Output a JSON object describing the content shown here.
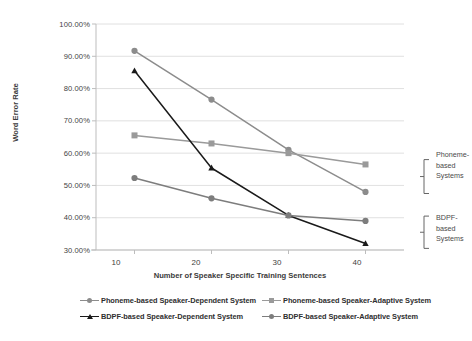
{
  "chart_data": {
    "type": "line",
    "title": "",
    "xlabel": "Number of Speaker Specific Training Sentences",
    "ylabel": "Word Error Rate",
    "x": [
      10,
      20,
      30,
      40
    ],
    "categories": [
      "10",
      "20",
      "30",
      "40"
    ],
    "xlim": [
      5,
      45
    ],
    "ylim": [
      0.3,
      1.0
    ],
    "ytick_labels": [
      "100.00%",
      "90.00%",
      "80.00%",
      "70.00%",
      "60.00%",
      "50.00%",
      "40.00%",
      "30.00%"
    ],
    "ytick_values": [
      1.0,
      0.9,
      0.8,
      0.7,
      0.6,
      0.5,
      0.4,
      0.3
    ],
    "grid": true,
    "legend_position": "bottom",
    "series": [
      {
        "name": "Phoneme-based Speaker-Dependent System",
        "values": [
          0.917,
          0.766,
          0.61,
          0.48
        ],
        "value_labels": [
          "91.70%",
          "76.60%",
          "61.00%",
          "48.00%"
        ],
        "color": "#8c8c8c",
        "marker": "circle"
      },
      {
        "name": "Phoneme-based Speaker-Adaptive System",
        "values": [
          0.655,
          0.63,
          0.6,
          0.565
        ],
        "value_labels": [
          "65.50%",
          "63.00%",
          "60.00%",
          "56.50%"
        ],
        "color": "#9a9a9a",
        "marker": "square"
      },
      {
        "name": "BDPF-based Speaker-Dependent System",
        "values": [
          0.855,
          0.554,
          0.407,
          0.32
        ],
        "value_labels": [
          "85.50%",
          "55.40%",
          "40.70%",
          "32.00%"
        ],
        "color": "#1a1a1a",
        "marker": "triangle"
      },
      {
        "name": "BDPF-based Speaker-Adaptive System",
        "values": [
          0.523,
          0.46,
          0.407,
          0.39
        ],
        "value_labels": [
          "52.30%",
          "46.00%",
          "40.70%",
          "39.00%"
        ],
        "color": "#7d7d7d",
        "marker": "circle"
      }
    ],
    "annotations": [
      {
        "text": "Phoneme-\nbased\nSystems",
        "group": "phoneme-based-systems",
        "bracket_top": 0.58,
        "bracket_bottom": 0.475
      },
      {
        "text": "BDPF-\nbased\nSystems",
        "group": "bdpf-based-systems",
        "bracket_top": 0.405,
        "bracket_bottom": 0.305
      }
    ]
  },
  "axes": {
    "yticks": [
      {
        "label": "100.00%"
      },
      {
        "label": "90.00%"
      },
      {
        "label": "80.00%"
      },
      {
        "label": "70.00%"
      },
      {
        "label": "60.00%"
      },
      {
        "label": "50.00%"
      },
      {
        "label": "40.00%"
      },
      {
        "label": "30.00%"
      }
    ],
    "xticks": [
      {
        "label": "10"
      },
      {
        "label": "20"
      },
      {
        "label": "30"
      },
      {
        "label": "40"
      }
    ],
    "ylabel": "Word Error Rate",
    "xlabel": "Number of Speaker Specific Training Sentences"
  },
  "annotations": {
    "phoneme": "Phoneme-\nbased\nSystems",
    "bdpf": "BDPF-\nbased\nSystems"
  },
  "legend": {
    "items": [
      {
        "label": "Phoneme-based Speaker-Dependent System",
        "color": "#8c8c8c",
        "marker": "circle"
      },
      {
        "label": "Phoneme-based Speaker-Adaptive System",
        "color": "#9a9a9a",
        "marker": "square"
      },
      {
        "label": "BDPF-based Speaker-Dependent System",
        "color": "#1a1a1a",
        "marker": "triangle"
      },
      {
        "label": "BDPF-based Speaker-Adaptive System",
        "color": "#7d7d7d",
        "marker": "circle"
      }
    ]
  },
  "colors": {
    "grid": "#d8d8d8",
    "axis": "#bdbdbd",
    "text": "#3f3f3f",
    "bracket": "#666666"
  }
}
